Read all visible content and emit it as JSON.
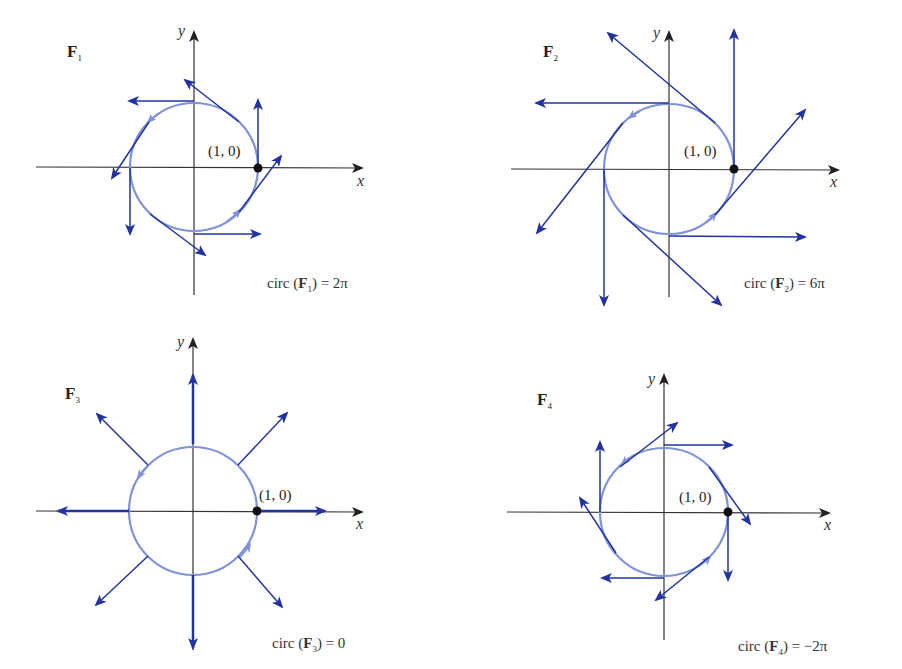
{
  "figure": {
    "colors": {
      "axis": "#333333",
      "vector": "#2233a0",
      "circle": "#7f93d6",
      "point": "#111111"
    },
    "point_label": "(1, 0)",
    "axis_labels": {
      "x": "x",
      "y": "y"
    },
    "panels": [
      {
        "id": "F1",
        "field_name": "F",
        "field_index": "1",
        "circ_text": "circ (",
        "circ_field": "F",
        "circ_index": "1",
        "circ_value": ") = 2π",
        "description": "Counterclockwise tangential field; circulation around unit circle equals 2π"
      },
      {
        "id": "F2",
        "field_name": "F",
        "field_index": "2",
        "circ_text": "circ (",
        "circ_field": "F",
        "circ_index": "2",
        "circ_value": ") = 6π",
        "description": "Counterclockwise tangential field three times longer; circulation 6π"
      },
      {
        "id": "F3",
        "field_name": "F",
        "field_index": "3",
        "circ_text": "circ (",
        "circ_field": "F",
        "circ_index": "3",
        "circ_value": ") = 0",
        "description": "Radial outward field; circulation 0"
      },
      {
        "id": "F4",
        "field_name": "F",
        "field_index": "4",
        "circ_text": "circ (",
        "circ_field": "F",
        "circ_index": "4",
        "circ_value": ") = −2π",
        "description": "Clockwise tangential field; circulation −2π"
      }
    ]
  }
}
